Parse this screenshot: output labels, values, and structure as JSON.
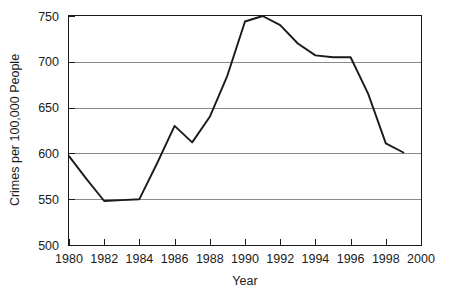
{
  "chart_data": {
    "type": "line",
    "title": "",
    "subtitle": "",
    "xlabel": "Year",
    "ylabel": "Crimes per 100,000 People",
    "xlim": [
      1980,
      2000
    ],
    "ylim": [
      500,
      750
    ],
    "grid": "horizontal",
    "legend": "none",
    "x_ticks": [
      1980,
      1982,
      1984,
      1986,
      1988,
      1990,
      1992,
      1994,
      1996,
      1998,
      2000
    ],
    "x_tick_labels": [
      "1980",
      "1982",
      "1984",
      "1986",
      "1988",
      "1990",
      "1992",
      "1994",
      "1996",
      "1998",
      "2000"
    ],
    "y_ticks": [
      500,
      550,
      600,
      650,
      700,
      750
    ],
    "y_tick_labels": [
      "500",
      "550",
      "600",
      "650",
      "700",
      "750"
    ],
    "x": [
      1980,
      1981,
      1982,
      1983,
      1984,
      1985,
      1986,
      1987,
      1988,
      1989,
      1990,
      1991,
      1992,
      1993,
      1994,
      1995,
      1996,
      1997,
      1998,
      1999
    ],
    "values": [
      597,
      572,
      548,
      549,
      550,
      589,
      630,
      612,
      640,
      685,
      744,
      750,
      740,
      720,
      707,
      705,
      705,
      665,
      611,
      601
    ],
    "series": [
      {
        "name": "Crime rate",
        "color": "#1a1a1a",
        "values": [
          597,
          572,
          548,
          549,
          550,
          589,
          630,
          612,
          640,
          685,
          744,
          750,
          740,
          720,
          707,
          705,
          705,
          665,
          611,
          601
        ]
      }
    ]
  },
  "axes": {
    "x_title": "Year",
    "y_title": "Crimes per 100,000 People"
  },
  "colors": {
    "line": "#1a1a1a",
    "grid": "#8a8a8a",
    "frame": "#1a1a1a",
    "background": "#ffffff"
  }
}
